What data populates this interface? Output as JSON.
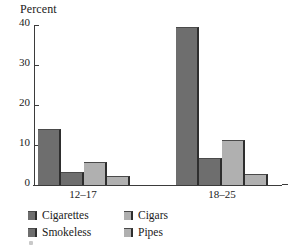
{
  "chart_data": {
    "type": "bar",
    "title": "",
    "xlabel": "",
    "ylabel": "Percent",
    "ylim": [
      0,
      40
    ],
    "yticks": [
      0,
      10,
      20,
      30,
      40
    ],
    "grid": false,
    "legend_position": "bottom-left",
    "categories": [
      "12–17",
      "18–25"
    ],
    "series": [
      {
        "name": "Cigarettes",
        "color": "#6e6e6e",
        "values": [
          14.0,
          39.5
        ]
      },
      {
        "name": "Smokeless",
        "color": "#6e6e6e",
        "values": [
          3.3,
          6.8
        ]
      },
      {
        "name": "Cigars",
        "color": "#b0b0b0",
        "values": [
          5.8,
          11.3
        ]
      },
      {
        "name": "Pipes",
        "color": "#b0b0b0",
        "values": [
          2.3,
          2.8
        ]
      }
    ]
  },
  "axis": {
    "y_title": "Percent",
    "y_tick_labels": [
      "40",
      "30",
      "20",
      "10",
      "0"
    ],
    "x_tick_labels": [
      "12–17",
      "18–25"
    ]
  },
  "legend": {
    "entries": [
      {
        "label": "Cigarettes",
        "tone": "dark"
      },
      {
        "label": "Cigars",
        "tone": "light"
      },
      {
        "label": "Smokeless",
        "tone": "dark"
      },
      {
        "label": "Pipes",
        "tone": "light"
      }
    ]
  },
  "colors": {
    "dark_bar": "#6e6e6e",
    "light_bar": "#b0b0b0",
    "bar_edge": "#2e2e2e",
    "axis": "#3b3b3b",
    "background": "#ffffff"
  }
}
